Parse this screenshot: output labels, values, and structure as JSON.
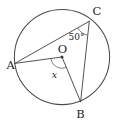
{
  "figure": {
    "kind": "circle-geometry-diagram",
    "background_color": "#ffffff",
    "stroke_color": "#4a4a4a",
    "label_color": "#1f1f1f"
  },
  "circle": {
    "name": "main-circle",
    "center_label": "O",
    "center_x": 62,
    "center_y": 57,
    "radius": 48
  },
  "points": [
    {
      "id": "A",
      "label": "A",
      "x": 14.5,
      "y": 63.5,
      "label_x": 8.5,
      "label_y": 68,
      "on_circle": true
    },
    {
      "id": "C",
      "label": "C",
      "x": 89.5,
      "y": 21.0,
      "label_x": 92.5,
      "label_y": 14,
      "on_circle": true
    },
    {
      "id": "B",
      "label": "B",
      "x": 80.5,
      "y": 102.0,
      "label_x": 80.5,
      "label_y": 117,
      "on_circle": true
    },
    {
      "id": "O",
      "label": "O",
      "x": 62.0,
      "y": 57.0,
      "label_x": 58.0,
      "label_y": 53,
      "on_circle": false
    }
  ],
  "segments": [
    {
      "name": "chord-AC",
      "from": "A",
      "to": "C",
      "type": "chord"
    },
    {
      "name": "chord-CB",
      "from": "C",
      "to": "B",
      "type": "chord"
    },
    {
      "name": "radius-OA",
      "from": "O",
      "to": "A",
      "type": "radius"
    },
    {
      "name": "radius-OB",
      "from": "O",
      "to": "B",
      "type": "radius"
    }
  ],
  "angles": [
    {
      "name": "inscribed-angle-at-C",
      "vertex": "C",
      "between": [
        "CA",
        "CB"
      ],
      "label": "50°",
      "label_x": 68.5,
      "label_y": 39.5,
      "arc_radius": 13
    },
    {
      "name": "central-angle-at-O",
      "vertex": "O",
      "between": [
        "OA",
        "OB"
      ],
      "label": "x",
      "label_x": 54.0,
      "label_y": 76.5,
      "arc_radius": 11
    }
  ],
  "labels": {
    "point_a": "A",
    "point_b": "B",
    "point_c": "C",
    "point_o": "O",
    "angle_at_c": "50°",
    "angle_at_o": "x"
  }
}
